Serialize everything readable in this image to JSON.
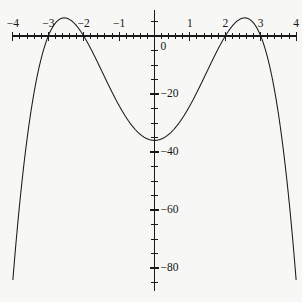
{
  "chart_data": {
    "type": "line",
    "title": "",
    "subtitle": "",
    "xlabel": "",
    "ylabel": "",
    "xlim": [
      -4,
      4
    ],
    "ylim": [
      -88,
      9
    ],
    "grid": false,
    "legend": null,
    "background_color": "#f7f7f5",
    "curve_color": "#1a1a1a",
    "axis_color": "#1a1a1a",
    "expression": "y = -(x^2 - 4)(x^2 - 9)",
    "x_ticks_major": [
      -4,
      -3,
      -2,
      -1,
      0,
      1,
      2,
      3,
      4
    ],
    "x_tick_labels": [
      "−4",
      "−3",
      "−2",
      "−1",
      "",
      "1",
      "2",
      "3",
      "4"
    ],
    "x_minor_step": 0.2,
    "y_ticks_major": [
      0,
      -20,
      -40,
      -60,
      -80
    ],
    "y_tick_labels": [
      "0",
      "−20",
      "−40",
      "−60",
      "−80"
    ],
    "y_minor_step": 5,
    "roots": [
      -3,
      -2,
      2,
      3
    ],
    "local_maxima": [
      {
        "x": -2.55,
        "y": 6.25
      },
      {
        "x": 2.55,
        "y": 6.25
      }
    ],
    "local_minima": [
      {
        "x": 0,
        "y": -36
      }
    ],
    "x": [
      -4,
      -3.8,
      -3.6,
      -3.4,
      -3.2,
      -3,
      -2.8,
      -2.6,
      -2.4,
      -2.2,
      -2,
      -1.8,
      -1.6,
      -1.4,
      -1.2,
      -1,
      -0.8,
      -0.6,
      -0.4,
      -0.2,
      0,
      0.2,
      0.4,
      0.6,
      0.8,
      1,
      1.2,
      1.4,
      1.6,
      1.8,
      2,
      2.2,
      2.4,
      2.6,
      2.8,
      3,
      3.2,
      3.4,
      3.6,
      3.8,
      4
    ],
    "y": [
      -84,
      -62.3,
      -43.3,
      -27.3,
      -14.1,
      0,
      3.8,
      5.9,
      6.1,
      4.5,
      0,
      -6.3,
      -14.3,
      -23.5,
      -33.2,
      -24,
      -29.9,
      -32.8,
      -34.7,
      -35.8,
      -36,
      -35.8,
      -34.7,
      -32.8,
      -29.9,
      -24,
      -33.2,
      -23.5,
      -14.3,
      -6.3,
      0,
      4.5,
      6.1,
      5.9,
      3.8,
      0,
      -14.1,
      -27.3,
      -43.3,
      -62.3,
      -84
    ]
  },
  "geometry": {
    "origin_x_px": 154.5,
    "origin_y_px": 36,
    "px_per_unit_x": 35.4,
    "px_per_unit_y": 2.9
  }
}
